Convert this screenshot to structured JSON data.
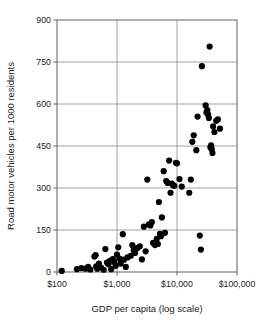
{
  "chart_data": {
    "type": "scatter",
    "title": "",
    "xlabel": "GDP per capita (log scale)",
    "ylabel": "Road motor vehicles per 1000 residents",
    "x_scale": "log",
    "xlim": [
      100,
      100000
    ],
    "ylim": [
      0,
      900
    ],
    "xticks": [
      100,
      1000,
      10000,
      100000
    ],
    "xtick_labels": [
      "$100",
      "$1,000",
      "$10,000",
      "$100,000"
    ],
    "yticks": [
      0,
      150,
      300,
      450,
      600,
      750,
      900
    ],
    "ytick_labels": [
      "0",
      "150",
      "300",
      "450",
      "600",
      "750",
      "900"
    ],
    "grid": "horizontal-and-vertical-at-ticks",
    "legend": "none",
    "marker": "filled-circle",
    "marker_color": "#000000",
    "points": [
      [
        120,
        4
      ],
      [
        215,
        10
      ],
      [
        255,
        14
      ],
      [
        300,
        12
      ],
      [
        330,
        18
      ],
      [
        360,
        9
      ],
      [
        420,
        55
      ],
      [
        440,
        60
      ],
      [
        450,
        20
      ],
      [
        470,
        12
      ],
      [
        500,
        30
      ],
      [
        540,
        16
      ],
      [
        600,
        8
      ],
      [
        640,
        82
      ],
      [
        680,
        34
      ],
      [
        720,
        28
      ],
      [
        760,
        40
      ],
      [
        800,
        10
      ],
      [
        850,
        46
      ],
      [
        900,
        36
      ],
      [
        950,
        22
      ],
      [
        1000,
        62
      ],
      [
        1050,
        88
      ],
      [
        1100,
        48
      ],
      [
        1150,
        30
      ],
      [
        1250,
        135
      ],
      [
        1300,
        44
      ],
      [
        1400,
        18
      ],
      [
        1500,
        52
      ],
      [
        1700,
        58
      ],
      [
        1800,
        96
      ],
      [
        1900,
        78
      ],
      [
        2000,
        68
      ],
      [
        2200,
        86
      ],
      [
        2400,
        92
      ],
      [
        2600,
        45
      ],
      [
        2800,
        162
      ],
      [
        3000,
        74
      ],
      [
        3200,
        330
      ],
      [
        3400,
        170
      ],
      [
        3600,
        166
      ],
      [
        3800,
        178
      ],
      [
        4000,
        104
      ],
      [
        4300,
        96
      ],
      [
        4600,
        118
      ],
      [
        4800,
        100
      ],
      [
        5000,
        250
      ],
      [
        5200,
        136
      ],
      [
        5400,
        128
      ],
      [
        5600,
        195
      ],
      [
        6000,
        360
      ],
      [
        6300,
        140
      ],
      [
        6600,
        325
      ],
      [
        7000,
        318
      ],
      [
        7400,
        398
      ],
      [
        7800,
        283
      ],
      [
        8200,
        316
      ],
      [
        8600,
        310
      ],
      [
        9000,
        308
      ],
      [
        9600,
        390
      ],
      [
        10000,
        388
      ],
      [
        11000,
        332
      ],
      [
        12000,
        305
      ],
      [
        16000,
        283
      ],
      [
        17000,
        330
      ],
      [
        18000,
        465
      ],
      [
        19000,
        488
      ],
      [
        21000,
        435
      ],
      [
        22000,
        555
      ],
      [
        24000,
        130
      ],
      [
        25000,
        80
      ],
      [
        26000,
        735
      ],
      [
        30000,
        595
      ],
      [
        31000,
        570
      ],
      [
        32000,
        578
      ],
      [
        33000,
        562
      ],
      [
        34000,
        550
      ],
      [
        35000,
        805
      ],
      [
        36000,
        445
      ],
      [
        37000,
        452
      ],
      [
        38000,
        438
      ],
      [
        39000,
        425
      ],
      [
        40000,
        520
      ],
      [
        42000,
        500
      ],
      [
        45000,
        540
      ],
      [
        48000,
        545
      ],
      [
        52000,
        512
      ]
    ]
  },
  "geometry": {
    "plot_left": 57,
    "plot_right": 237,
    "plot_top": 20,
    "plot_bottom": 272,
    "marker_radius": 3.1
  }
}
